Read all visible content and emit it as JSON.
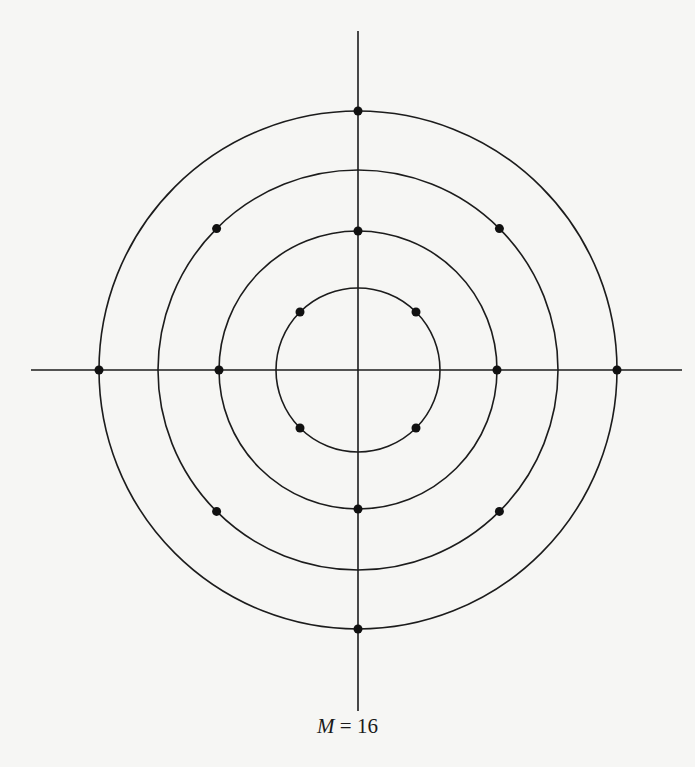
{
  "diagram": {
    "caption": {
      "variable": "M",
      "equals": "=",
      "value": "16"
    },
    "colors": {
      "line": "#1c1c1c",
      "background": "#f6f6f4",
      "point": "#111111"
    },
    "center": [
      358,
      370
    ],
    "axes": {
      "horizontal": {
        "x1": 31,
        "x2": 682,
        "y": 370
      },
      "vertical": {
        "x": 358,
        "y1": 31,
        "y2": 711
      }
    },
    "rings": [
      {
        "name": "ring-1",
        "radius": 82,
        "point_angles_deg": [
          45,
          135,
          225,
          315
        ]
      },
      {
        "name": "ring-2",
        "radius": 139,
        "point_angles_deg": [
          0,
          90,
          180,
          270
        ]
      },
      {
        "name": "ring-3",
        "radius": 200,
        "point_angles_deg": [
          45,
          135,
          225,
          315
        ]
      },
      {
        "name": "ring-4",
        "radius": 259,
        "point_angles_deg": [
          0,
          90,
          180,
          270
        ]
      }
    ],
    "point_radius": 4.5
  }
}
